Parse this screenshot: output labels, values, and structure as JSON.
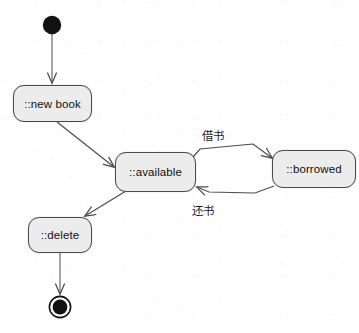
{
  "diagram": {
    "type": "uml-state-diagram",
    "canvas": {
      "width": 359,
      "height": 333,
      "background": "#fefefe"
    },
    "style": {
      "node_fill": "#ececec",
      "node_stroke": "#4a4a4a",
      "edge_stroke": "#555555",
      "text_color": "#111111"
    }
  },
  "nodes": {
    "initial": {
      "name": "initial-state",
      "label": "",
      "cx": 52,
      "cy": 25,
      "r": 9
    },
    "new_book": {
      "label": "::new book",
      "x": 13,
      "y": 85,
      "w": 79,
      "h": 37
    },
    "available": {
      "label": "::available",
      "x": 115,
      "y": 152,
      "w": 81,
      "h": 40
    },
    "borrowed": {
      "label": "::borrowed",
      "x": 272,
      "y": 150,
      "w": 84,
      "h": 38
    },
    "delete": {
      "label": "::delete",
      "x": 28,
      "y": 217,
      "w": 64,
      "h": 36
    },
    "final": {
      "name": "final-state",
      "label": "",
      "cx": 60,
      "cy": 307,
      "r_outer": 11,
      "r_inner": 7.5
    }
  },
  "transitions": [
    {
      "id": "t1",
      "from": "initial",
      "to": "new_book",
      "label": ""
    },
    {
      "id": "t2",
      "from": "new_book",
      "to": "available",
      "label": ""
    },
    {
      "id": "t3",
      "from": "available",
      "to": "borrowed",
      "label": "借书"
    },
    {
      "id": "t4",
      "from": "borrowed",
      "to": "available",
      "label": "还书"
    },
    {
      "id": "t5",
      "from": "available",
      "to": "delete",
      "label": ""
    },
    {
      "id": "t6",
      "from": "delete",
      "to": "final",
      "label": ""
    }
  ],
  "labels": {
    "borrow": "借书",
    "return": "还书"
  }
}
